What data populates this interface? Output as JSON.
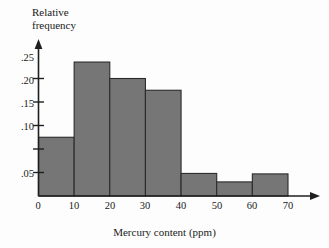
{
  "chart_data": {
    "type": "bar",
    "title": "",
    "subtitle": "",
    "xlabel": "Mercury content (ppm)",
    "ylabel": "Relative frequency",
    "ylabel_line1": "Relative",
    "ylabel_line2": "frequency",
    "xlim": [
      0,
      70
    ],
    "ylim": [
      0,
      0.3
    ],
    "grid": false,
    "legend": null,
    "bin_width": 10,
    "bin_edges": [
      0,
      10,
      20,
      30,
      40,
      50,
      60,
      70
    ],
    "categories": [
      "0-10",
      "10-20",
      "20-30",
      "30-40",
      "40-50",
      "50-60",
      "60-70"
    ],
    "values": [
      0.125,
      0.285,
      0.25,
      0.225,
      0.048,
      0.03,
      0.047
    ],
    "xticks": [
      0,
      10,
      20,
      30,
      40,
      50,
      60,
      70
    ],
    "xtick_labels": [
      "0",
      "10",
      "20",
      "30",
      "40",
      "50",
      "60",
      "70"
    ],
    "yticks": [
      0.05,
      0.1,
      0.15,
      0.2,
      0.25
    ],
    "ytick_labels": [
      ".05",
      ".10",
      ".15",
      ".20",
      ".25"
    ],
    "bar_color": "#767676",
    "bar_edge_color": "#2b2b2b",
    "axis_color": "#1f1f1f"
  }
}
